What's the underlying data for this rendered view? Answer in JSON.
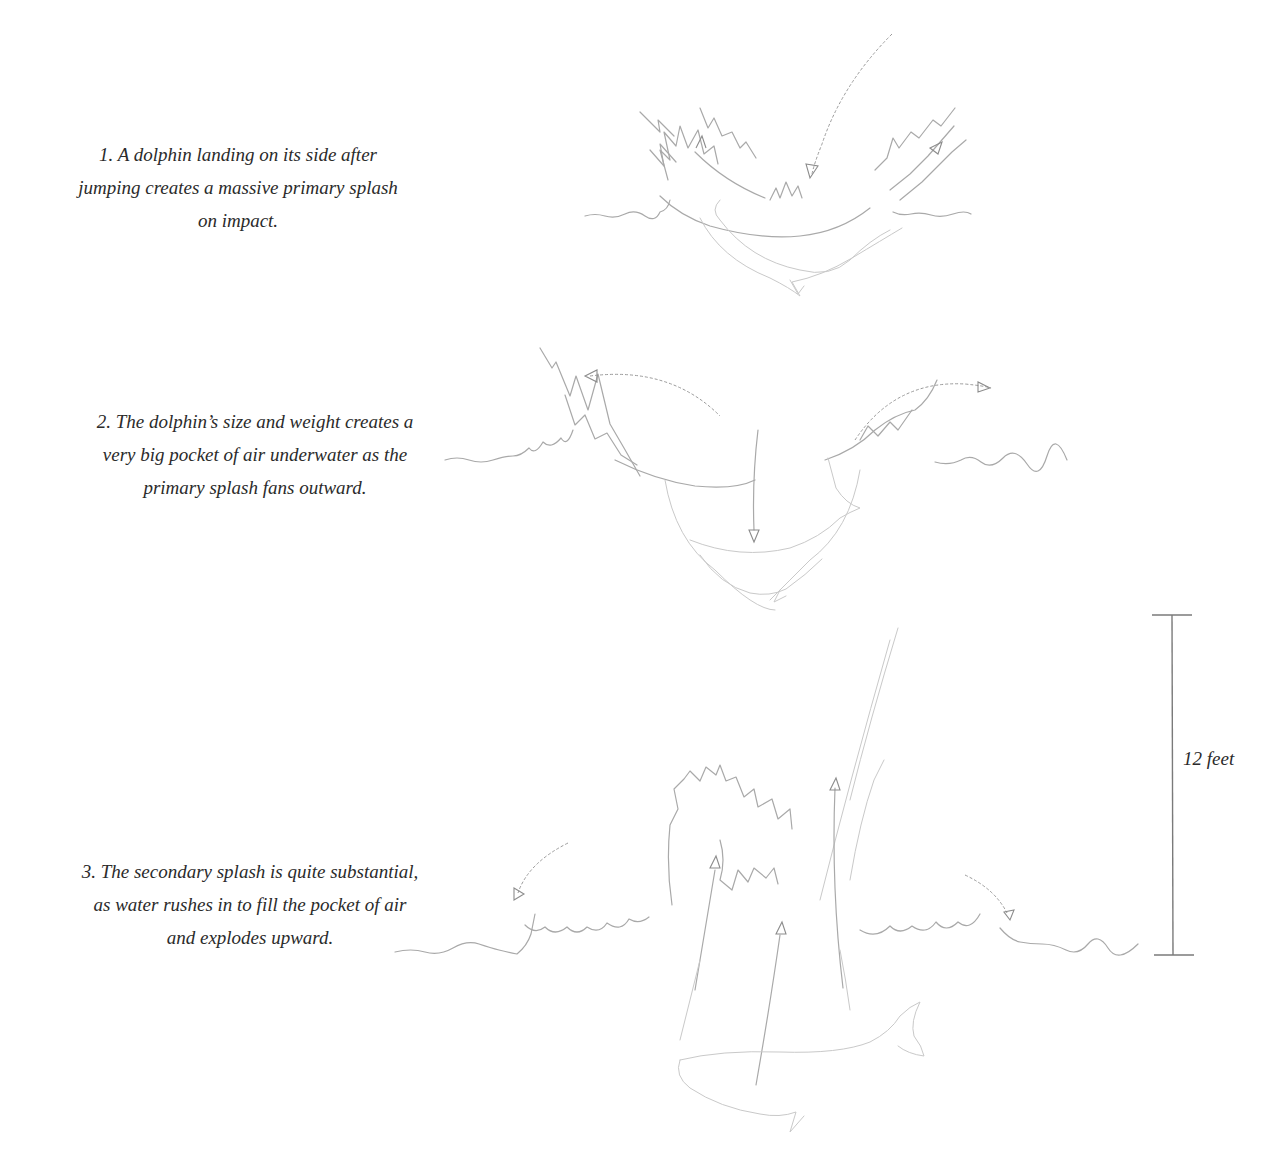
{
  "diagram": {
    "stages": [
      {
        "number": 1,
        "caption_lines": [
          "1. A dolphin landing on its side after",
          "jumping creates a massive primary splash",
          "on impact."
        ]
      },
      {
        "number": 2,
        "caption_lines": [
          "2. The dolphin’s size and weight creates a",
          "very big pocket of air underwater as the",
          "primary splash fans outward."
        ]
      },
      {
        "number": 3,
        "caption_lines": [
          "3. The secondary splash is quite substantial,",
          "as water rushes in to fill the pocket of air",
          "and explodes upward."
        ]
      }
    ],
    "scale_bar": {
      "label": "12 feet",
      "applies_to_stage": 3
    },
    "colors": {
      "background": "#ffffff",
      "text": "#2b2b2b",
      "pencil": "#a9a9a9",
      "scale_bar": "#7a7a7a"
    }
  }
}
